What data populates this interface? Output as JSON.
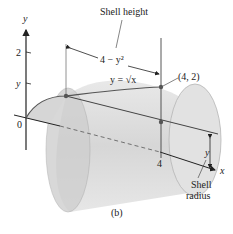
{
  "figure": {
    "caption": "(b)",
    "labels": {
      "y_axis": "y",
      "x_axis": "x",
      "tick_2": "2",
      "tick_y": "y",
      "origin": "0",
      "tick_4": "4",
      "shell_height": "Shell height",
      "height_expr": "4 − y²",
      "curve": "y = √x",
      "point": "(4, 2)",
      "radius_y": "y",
      "shell_radius_line1": "Shell",
      "shell_radius_line2": "radius"
    },
    "colors": {
      "shell_fill": "#d9d9d9",
      "shell_dark": "#bdbdbd",
      "axis": "#222222",
      "curve": "#555555"
    }
  }
}
